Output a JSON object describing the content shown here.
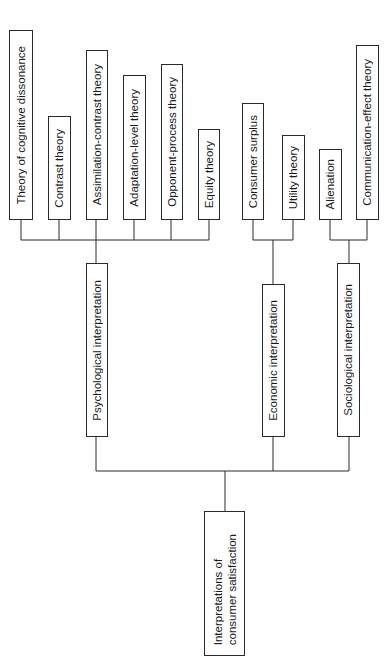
{
  "root": {
    "label": "Interpretations of\nconsumer satisfaction"
  },
  "categories": [
    {
      "label": "Psychological interpretation",
      "theories": [
        "Theory of cognitive dissonance",
        "Contrast theory",
        "Assimilation-contrast theory",
        "Adaptation-level theory",
        "Opponent-process theory",
        "Equity theory"
      ]
    },
    {
      "label": "Economic interpretation",
      "theories": [
        "Consumer surplus",
        "Utility theory"
      ]
    },
    {
      "label": "Sociological interpretation",
      "theories": [
        "Alienation",
        "Communication-effect theory"
      ]
    }
  ]
}
